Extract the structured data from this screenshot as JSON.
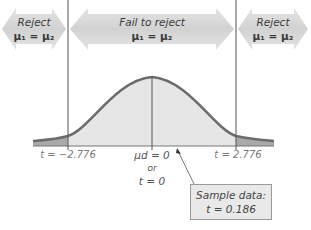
{
  "diagram": {
    "type": "t-distribution hypothesis test",
    "regions": {
      "left": {
        "line1": "Reject",
        "line2": "μ₁ = μ₂"
      },
      "center": {
        "line1": "Fail to reject",
        "line2": "μ₁ = μ₂"
      },
      "right": {
        "line1": "Reject",
        "line2": "μ₁ = μ₂"
      }
    },
    "axis": {
      "left_critical": "t = −2.776",
      "right_critical": "t = 2.776",
      "center_line1": "μd = 0",
      "center_line2": "or",
      "center_line3": "t = 0"
    },
    "callout": {
      "line1": "Sample data:",
      "line2": "t = 0.186"
    },
    "colors": {
      "arrow_fill": "#d9d9d9",
      "curve_stroke": "#6b6b6b",
      "center_fill": "#e6e6e6",
      "tail_fill": "#a9a9a9",
      "line": "#555555"
    }
  }
}
